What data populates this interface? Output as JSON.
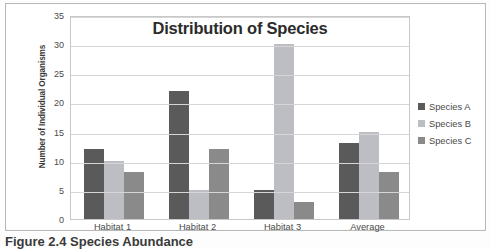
{
  "chart_data": {
    "type": "bar",
    "title": "Distribution of Species",
    "xlabel": "",
    "ylabel": "Number of Individual Organisms",
    "categories": [
      "Habitat 1",
      "Habitat 2",
      "Habitat 3",
      "Average"
    ],
    "series": [
      {
        "name": "Species A",
        "values": [
          12,
          22,
          5,
          13
        ],
        "color": "#5a5a5a"
      },
      {
        "name": "Species B",
        "values": [
          10,
          5,
          30,
          15
        ],
        "color": "#bdbdc4"
      },
      {
        "name": "Species C",
        "values": [
          8,
          12,
          3,
          8
        ],
        "color": "#8a8a8a"
      }
    ],
    "ylim": [
      0,
      35
    ],
    "ytick_values": [
      0,
      5,
      10,
      15,
      20,
      25,
      30,
      35
    ],
    "ytick_labels": [
      "0",
      "5",
      "10",
      "15",
      "20",
      "25",
      "30",
      "35"
    ],
    "grid": true,
    "legend_position": "right"
  },
  "caption": {
    "text": "Figure 2.4 Species Abundance"
  },
  "colors": {
    "gridline": "#d6d6d6",
    "plot_border": "#c8c8c8",
    "page_border": "#b9b9b9",
    "title_text": "#2b2b2b",
    "label_text": "#4a4a4a"
  }
}
